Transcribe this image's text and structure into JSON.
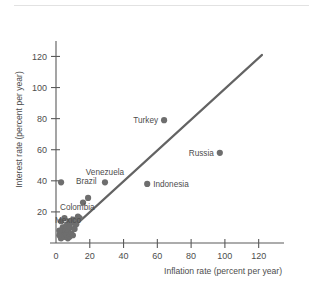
{
  "figure": {
    "background_color": "#ffffff",
    "ink_color": "#4d4d4d",
    "marker_color": "#6e6e6e",
    "reference_line_color": "#636363",
    "top_rule_color": "#e2e2e2"
  },
  "chart_data": {
    "type": "scatter",
    "title": "",
    "subtitle": "",
    "xlabel": "Inflation rate (percent per year)",
    "ylabel": "Interest rate (percent per year)",
    "xlim": [
      0,
      135
    ],
    "ylim": [
      0,
      128
    ],
    "xticks": [
      0,
      20,
      40,
      60,
      80,
      100,
      120
    ],
    "yticks": [
      0,
      20,
      40,
      60,
      80,
      100,
      120
    ],
    "xticklabels": [
      "0",
      "20",
      "40",
      "60",
      "80",
      "100",
      "120"
    ],
    "yticklabels": [
      "0",
      "20",
      "40",
      "60",
      "80",
      "100",
      "120"
    ],
    "grid": false,
    "legend": null,
    "annotations": [
      {
        "text": "Turkey",
        "x": 64,
        "y": 79,
        "label_side": "left"
      },
      {
        "text": "Russia",
        "x": 97,
        "y": 58,
        "label_side": "left"
      },
      {
        "text": "Indonesia",
        "x": 54,
        "y": 38,
        "label_side": "right"
      },
      {
        "text": "Venezuela",
        "x": 29,
        "y": 39,
        "label_side": "above"
      },
      {
        "text": "Brazil",
        "x": 3,
        "y": 39,
        "label_side": "right"
      },
      {
        "text": "Colombia",
        "x": 19,
        "y": 29,
        "label_side": "left"
      },
      {
        "text": "Mexico",
        "x": 16,
        "y": 26,
        "label_side": "left"
      }
    ],
    "reference_line": {
      "description": "45-degree line where interest rate equals inflation rate",
      "x": [
        2,
        122
      ],
      "y": [
        2,
        121
      ]
    },
    "series": [
      {
        "name": "Countries",
        "marker": "circle",
        "color": "#6e6e6e",
        "points": [
          {
            "x": 64,
            "y": 79,
            "label": "Turkey"
          },
          {
            "x": 97,
            "y": 58,
            "label": "Russia"
          },
          {
            "x": 54,
            "y": 38,
            "label": "Indonesia"
          },
          {
            "x": 29,
            "y": 39,
            "label": "Venezuela"
          },
          {
            "x": 3,
            "y": 39,
            "label": "Brazil"
          },
          {
            "x": 19,
            "y": 29,
            "label": "Colombia"
          },
          {
            "x": 16,
            "y": 26,
            "label": "Mexico"
          },
          {
            "x": 3,
            "y": 14,
            "label": ""
          },
          {
            "x": 5,
            "y": 16,
            "label": ""
          },
          {
            "x": 7,
            "y": 12,
            "label": ""
          },
          {
            "x": 8,
            "y": 14,
            "label": ""
          },
          {
            "x": 9,
            "y": 13,
            "label": ""
          },
          {
            "x": 10,
            "y": 15,
            "label": ""
          },
          {
            "x": 11,
            "y": 13,
            "label": ""
          },
          {
            "x": 12,
            "y": 14,
            "label": ""
          },
          {
            "x": 13,
            "y": 17,
            "label": ""
          },
          {
            "x": 14,
            "y": 16,
            "label": ""
          },
          {
            "x": 12,
            "y": 12,
            "label": ""
          },
          {
            "x": 4,
            "y": 10,
            "label": ""
          },
          {
            "x": 5,
            "y": 8,
            "label": ""
          },
          {
            "x": 6,
            "y": 9,
            "label": ""
          },
          {
            "x": 7,
            "y": 7,
            "label": ""
          },
          {
            "x": 3,
            "y": 7,
            "label": ""
          },
          {
            "x": 4,
            "y": 5,
            "label": ""
          },
          {
            "x": 5,
            "y": 4,
            "label": ""
          },
          {
            "x": 6,
            "y": 5,
            "label": ""
          },
          {
            "x": 7,
            "y": 3,
            "label": ""
          },
          {
            "x": 8,
            "y": 4,
            "label": ""
          },
          {
            "x": 9,
            "y": 6,
            "label": ""
          },
          {
            "x": 10,
            "y": 5,
            "label": ""
          },
          {
            "x": 3,
            "y": 3,
            "label": ""
          },
          {
            "x": 2,
            "y": 5,
            "label": ""
          },
          {
            "x": 2,
            "y": 8,
            "label": ""
          },
          {
            "x": 6,
            "y": 11,
            "label": ""
          },
          {
            "x": 8,
            "y": 10,
            "label": ""
          },
          {
            "x": 11,
            "y": 9,
            "label": ""
          }
        ]
      }
    ]
  }
}
